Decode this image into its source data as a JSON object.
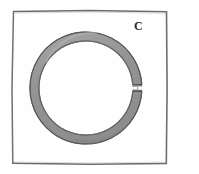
{
  "figure": {
    "caption_letter": "C",
    "background_color": "#fefefe",
    "frame": {
      "stroke_color": "#5c5c5c",
      "fill_color": "#ffffff",
      "x": 12,
      "y": 11,
      "width": 155,
      "height": 153
    },
    "ring": {
      "shape_name": "split-ring-annulus",
      "center_x": 86,
      "center_y": 88,
      "outer_radius": 56,
      "inner_radius": 47,
      "band_width": 9,
      "fill_color": "#9a9a99",
      "outline_color": "#4a4a4a",
      "gap": {
        "present": true,
        "position_label": "right",
        "angle_degrees": 3,
        "width_px": 3
      }
    }
  }
}
